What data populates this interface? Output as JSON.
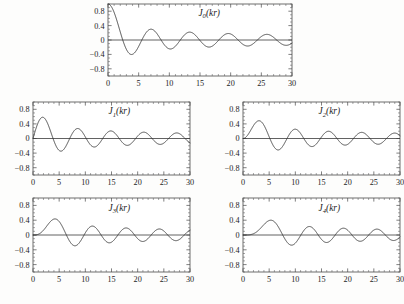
{
  "figure": {
    "background_color": "#fdfdfc",
    "curve_color": "#2e2e2e",
    "frame_color": "#4a4a4a"
  },
  "chart_data": [
    {
      "type": "line",
      "panel_id": "panel-j0",
      "title": "J0(kr)",
      "label_base": "J",
      "label_order": "0",
      "label_arg": "(kr)",
      "order": 0,
      "xlabel": "",
      "ylabel": "",
      "xlim": [
        0,
        30
      ],
      "ylim": [
        -1.0,
        1.0
      ],
      "xticks": [
        0,
        5,
        10,
        15,
        20,
        25,
        30
      ],
      "xticklabels": [
        "0",
        "5",
        "10",
        "15",
        "20",
        "25",
        "30"
      ],
      "yticks": [
        -0.8,
        -0.4,
        0,
        0.4,
        0.8
      ],
      "yticklabels": [
        "-0.8",
        "-0.4",
        "0",
        "0.4",
        "0.8"
      ],
      "grid": false,
      "legend": "none",
      "zeros": [
        2.405,
        5.52,
        8.654,
        11.792,
        14.931,
        18.071,
        21.212,
        24.352,
        27.493
      ],
      "extrema": [
        {
          "x": 0.0,
          "y": 1.0
        },
        {
          "x": 3.832,
          "y": -0.403
        },
        {
          "x": 7.016,
          "y": 0.3
        },
        {
          "x": 10.174,
          "y": -0.25
        },
        {
          "x": 13.324,
          "y": 0.218
        },
        {
          "x": 16.471,
          "y": -0.197
        },
        {
          "x": 19.616,
          "y": 0.181
        },
        {
          "x": 22.76,
          "y": -0.168
        },
        {
          "x": 25.904,
          "y": 0.158
        },
        {
          "x": 29.047,
          "y": -0.15
        }
      ]
    },
    {
      "type": "line",
      "panel_id": "panel-j1",
      "title": "J1(kr)",
      "label_base": "J",
      "label_order": "1",
      "label_arg": "(kr)",
      "order": 1,
      "xlabel": "",
      "ylabel": "",
      "xlim": [
        0,
        30
      ],
      "ylim": [
        -1.0,
        1.0
      ],
      "xticks": [
        0,
        5,
        10,
        15,
        20,
        25,
        30
      ],
      "xticklabels": [
        "0",
        "5",
        "10",
        "15",
        "20",
        "25",
        "30"
      ],
      "yticks": [
        -0.8,
        -0.4,
        0,
        0.4,
        0.8
      ],
      "yticklabels": [
        "-0.8",
        "-0.4",
        "0",
        "0.4",
        "0.8"
      ],
      "grid": false,
      "legend": "none",
      "zeros": [
        0.0,
        3.832,
        7.016,
        10.174,
        13.324,
        16.471,
        19.616,
        22.76,
        25.904,
        29.047
      ],
      "extrema": [
        {
          "x": 1.841,
          "y": 0.582
        },
        {
          "x": 5.331,
          "y": -0.346
        },
        {
          "x": 8.536,
          "y": 0.273
        },
        {
          "x": 11.706,
          "y": -0.233
        },
        {
          "x": 14.864,
          "y": 0.207
        },
        {
          "x": 18.016,
          "y": -0.188
        },
        {
          "x": 21.164,
          "y": 0.174
        },
        {
          "x": 24.311,
          "y": -0.162
        },
        {
          "x": 27.457,
          "y": 0.153
        }
      ]
    },
    {
      "type": "line",
      "panel_id": "panel-j2",
      "title": "J2(kr)",
      "label_base": "J",
      "label_order": "2",
      "label_arg": "(kr)",
      "order": 2,
      "xlabel": "",
      "ylabel": "",
      "xlim": [
        0,
        30
      ],
      "ylim": [
        -1.0,
        1.0
      ],
      "xticks": [
        0,
        5,
        10,
        15,
        20,
        25,
        30
      ],
      "xticklabels": [
        "0",
        "5",
        "10",
        "15",
        "20",
        "25",
        "30"
      ],
      "yticks": [
        -0.8,
        -0.4,
        0,
        0.4,
        0.8
      ],
      "yticklabels": [
        "-0.8",
        "-0.4",
        "0",
        "0.4",
        "0.8"
      ],
      "grid": false,
      "legend": "none",
      "zeros": [
        0.0,
        5.136,
        8.417,
        11.62,
        14.796,
        17.96,
        21.117,
        24.27,
        27.421
      ],
      "extrema": [
        {
          "x": 3.054,
          "y": 0.486
        },
        {
          "x": 6.706,
          "y": -0.313
        },
        {
          "x": 9.969,
          "y": 0.255
        },
        {
          "x": 13.17,
          "y": -0.221
        },
        {
          "x": 16.348,
          "y": 0.199
        },
        {
          "x": 19.513,
          "y": -0.182
        },
        {
          "x": 22.672,
          "y": 0.169
        },
        {
          "x": 25.826,
          "y": -0.159
        },
        {
          "x": 28.977,
          "y": 0.15
        }
      ]
    },
    {
      "type": "line",
      "panel_id": "panel-j3",
      "title": "J3(kr)",
      "label_base": "J",
      "label_order": "3",
      "label_arg": "(kr)",
      "order": 3,
      "xlabel": "",
      "ylabel": "",
      "xlim": [
        0,
        30
      ],
      "ylim": [
        -1.0,
        1.0
      ],
      "xticks": [
        0,
        5,
        10,
        15,
        20,
        25,
        30
      ],
      "xticklabels": [
        "0",
        "5",
        "10",
        "15",
        "20",
        "25",
        "30"
      ],
      "yticks": [
        -0.8,
        -0.4,
        0,
        0.4,
        0.8
      ],
      "yticklabels": [
        "-0.8",
        "-0.4",
        "0",
        "0.4",
        "0.8"
      ],
      "grid": false,
      "legend": "none",
      "zeros": [
        0.0,
        6.38,
        9.761,
        13.015,
        16.223,
        19.409,
        22.583,
        25.748,
        28.908
      ],
      "extrema": [
        {
          "x": 4.201,
          "y": 0.434
        },
        {
          "x": 8.015,
          "y": -0.291
        },
        {
          "x": 11.346,
          "y": 0.243
        },
        {
          "x": 14.586,
          "y": -0.213
        },
        {
          "x": 17.789,
          "y": 0.193
        },
        {
          "x": 20.972,
          "y": -0.177
        },
        {
          "x": 24.145,
          "y": 0.165
        },
        {
          "x": 27.31,
          "y": -0.155
        }
      ]
    },
    {
      "type": "line",
      "panel_id": "panel-j4",
      "title": "J4(kr)",
      "label_base": "J",
      "label_order": "4",
      "label_arg": "(kr)",
      "order": 4,
      "xlabel": "",
      "ylabel": "",
      "xlim": [
        0,
        30
      ],
      "ylim": [
        -1.0,
        1.0
      ],
      "xticks": [
        0,
        5,
        10,
        15,
        20,
        25,
        30
      ],
      "xticklabels": [
        "0",
        "5",
        "10",
        "15",
        "20",
        "25",
        "30"
      ],
      "yticks": [
        -0.8,
        -0.4,
        0,
        0.4,
        0.8
      ],
      "yticklabels": [
        "-0.8",
        "-0.4",
        "0",
        "0.4",
        "0.8"
      ],
      "grid": false,
      "legend": "none",
      "zeros": [
        0.0,
        7.588,
        11.065,
        14.373,
        17.616,
        20.827,
        24.019,
        27.199
      ],
      "extrema": [
        {
          "x": 5.318,
          "y": 0.391
        },
        {
          "x": 9.282,
          "y": -0.272
        },
        {
          "x": 12.682,
          "y": 0.232
        },
        {
          "x": 15.964,
          "y": -0.206
        },
        {
          "x": 19.196,
          "y": 0.188
        },
        {
          "x": 22.401,
          "y": -0.173
        },
        {
          "x": 25.59,
          "y": 0.162
        },
        {
          "x": 28.767,
          "y": -0.152
        }
      ]
    }
  ],
  "layout": {
    "panels": [
      {
        "id": "panel-j0",
        "left": 108,
        "top": 4,
        "width": 184,
        "height": 72,
        "row": "top",
        "col": "center"
      },
      {
        "id": "panel-j1",
        "left": 33,
        "top": 102,
        "width": 157,
        "height": 73,
        "row": "middle",
        "col": "left"
      },
      {
        "id": "panel-j2",
        "left": 243,
        "top": 102,
        "width": 157,
        "height": 73,
        "row": "middle",
        "col": "right"
      },
      {
        "id": "panel-j3",
        "left": 33,
        "top": 198,
        "width": 157,
        "height": 74,
        "row": "bottom",
        "col": "left"
      },
      {
        "id": "panel-j4",
        "left": 243,
        "top": 198,
        "width": 157,
        "height": 74,
        "row": "bottom",
        "col": "right"
      }
    ]
  }
}
